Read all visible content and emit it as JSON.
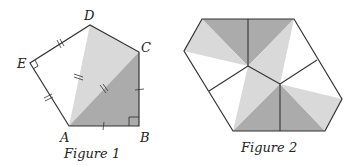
{
  "figure1": {
    "caption": "Figure 1",
    "vertices": {
      "A": {
        "label": "A",
        "x": 69,
        "y": 126
      },
      "B": {
        "label": "B",
        "x": 139,
        "y": 126
      },
      "C": {
        "label": "C",
        "x": 139,
        "y": 52
      },
      "D": {
        "label": "D",
        "x": 90,
        "y": 25
      },
      "E": {
        "label": "E",
        "x": 30,
        "y": 63
      }
    },
    "colors": {
      "dark": "#a9a9a9",
      "light": "#d9d9d9",
      "line": "#333333"
    }
  },
  "figure2": {
    "caption": "Figure 2",
    "colors": {
      "dark": "#a9a9a9",
      "light": "#d9d9d9",
      "line": "#333333"
    }
  }
}
